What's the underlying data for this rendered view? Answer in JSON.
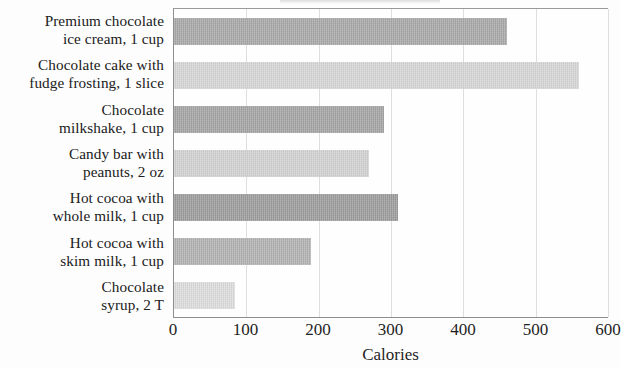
{
  "chart_data": {
    "type": "bar",
    "orientation": "horizontal",
    "title": "",
    "xlabel": "Calories",
    "ylabel": "",
    "xlim": [
      0,
      600
    ],
    "xticks": [
      0,
      100,
      200,
      300,
      400,
      500,
      600
    ],
    "xtick_labels": [
      "0",
      "100",
      "200",
      "300",
      "400",
      "500",
      "600"
    ],
    "grid": true,
    "grid_axis": "x",
    "legend": false,
    "categories": [
      "Premium chocolate ice cream, 1 cup",
      "Chocolate cake with fudge frosting, 1 slice",
      "Chocolate milkshake, 1 cup",
      "Candy bar with peanuts, 2 oz",
      "Hot cocoa with whole milk, 1 cup",
      "Hot cocoa with skim milk, 1 cup",
      "Chocolate syrup, 2 T"
    ],
    "values": [
      460,
      560,
      290,
      270,
      310,
      190,
      85
    ],
    "bar_colors": [
      "#a6a6a6",
      "#d5d5d5",
      "#a2a2a2",
      "#d0d0d0",
      "#9a9a9a",
      "#b0b0b0",
      "#dcdcdc"
    ]
  },
  "axis": {
    "x_title": "Calories",
    "ticks": [
      {
        "label": "0",
        "value": 0
      },
      {
        "label": "100",
        "value": 100
      },
      {
        "label": "200",
        "value": 200
      },
      {
        "label": "300",
        "value": 300
      },
      {
        "label": "400",
        "value": 400
      },
      {
        "label": "500",
        "value": 500
      },
      {
        "label": "600",
        "value": 600
      }
    ]
  },
  "categories": [
    {
      "line1": "Premium chocolate",
      "line2": "ice cream, 1 cup",
      "value": 460,
      "color": "#a6a6a6"
    },
    {
      "line1": "Chocolate cake with",
      "line2": "fudge frosting, 1 slice",
      "value": 560,
      "color": "#d5d5d5"
    },
    {
      "line1": "Chocolate",
      "line2": "milkshake, 1 cup",
      "value": 290,
      "color": "#a2a2a2"
    },
    {
      "line1": "Candy bar with",
      "line2": "peanuts, 2 oz",
      "value": 270,
      "color": "#d0d0d0"
    },
    {
      "line1": "Hot cocoa with",
      "line2": "whole milk, 1 cup",
      "value": 310,
      "color": "#9a9a9a"
    },
    {
      "line1": "Hot cocoa with",
      "line2": "skim milk, 1 cup",
      "value": 190,
      "color": "#b0b0b0"
    },
    {
      "line1": "Chocolate",
      "line2": "syrup, 2 T",
      "value": 85,
      "color": "#dcdcdc"
    }
  ]
}
